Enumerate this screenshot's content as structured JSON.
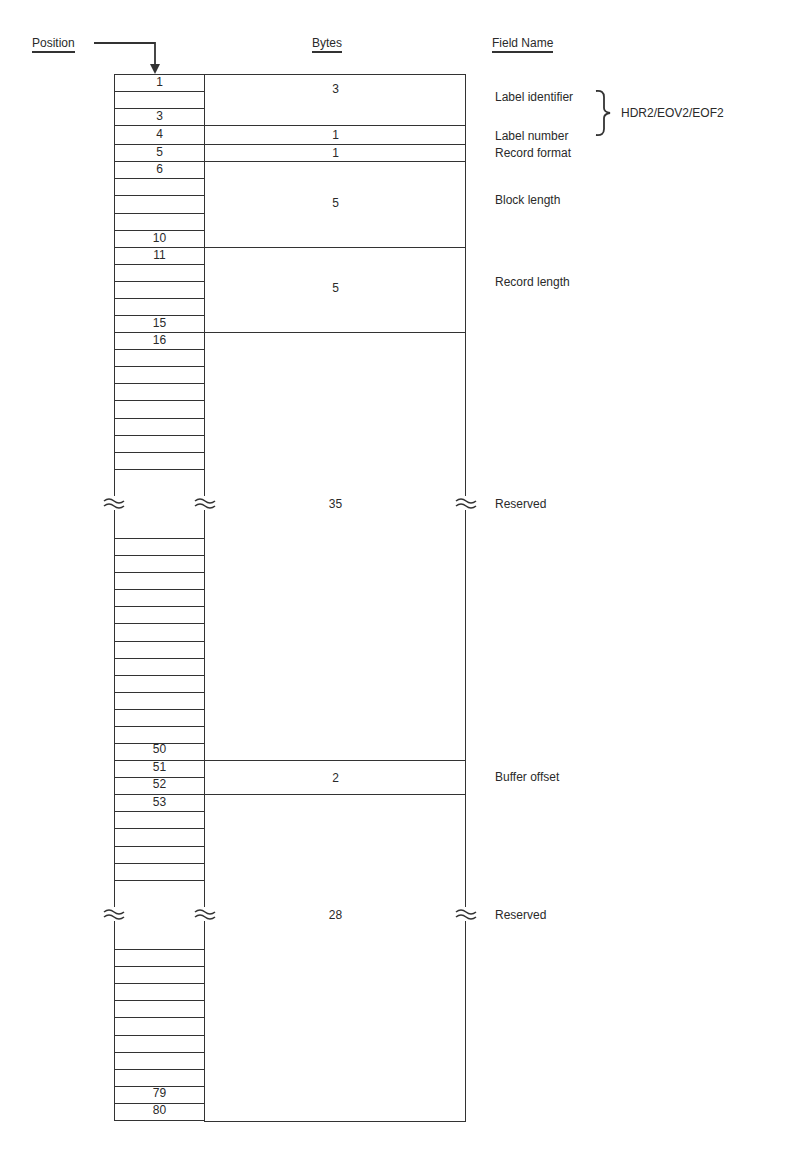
{
  "headers": {
    "position": "Position",
    "bytes": "Bytes",
    "field_name": "Field Name"
  },
  "group_label": "HDR2/EOV2/EOF2",
  "fields": [
    {
      "name": "Label identifier",
      "bytes": "3",
      "start": 1,
      "end": 3
    },
    {
      "name": "Label number",
      "bytes": "1",
      "start": 4,
      "end": 4
    },
    {
      "name": "Record format",
      "bytes": "1",
      "start": 5,
      "end": 5
    },
    {
      "name": "Block length",
      "bytes": "5",
      "start": 6,
      "end": 10
    },
    {
      "name": "Record length",
      "bytes": "5",
      "start": 11,
      "end": 15
    },
    {
      "name": "Reserved",
      "bytes": "35",
      "start": 16,
      "end": 50
    },
    {
      "name": "Buffer offset",
      "bytes": "2",
      "start": 51,
      "end": 52
    },
    {
      "name": "Reserved",
      "bytes": "28",
      "start": 53,
      "end": 80
    }
  ],
  "position_labels": [
    "1",
    "3",
    "4",
    "5",
    "6",
    "10",
    "11",
    "15",
    "16",
    "50",
    "51",
    "52",
    "53",
    "79",
    "80"
  ],
  "colors": {
    "line": "#333333",
    "background": "#ffffff",
    "text": "#2a2a2a"
  }
}
